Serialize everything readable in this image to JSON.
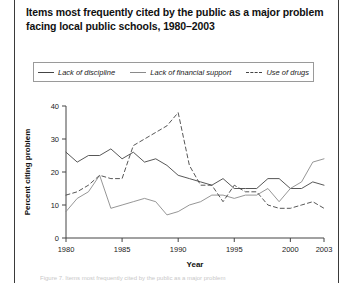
{
  "figure": {
    "title": "Items most frequently cited by the public as a major problem facing local public schools, 1980–2003",
    "footer_partial": "Figure 7. Items most frequently cited by the public as a major problem"
  },
  "legend": {
    "items": [
      {
        "label": "Lack of discipline",
        "style": "solid-dark",
        "color": "#444444"
      },
      {
        "label": "Lack of financial support",
        "style": "solid-mid",
        "color": "#8a8a8a"
      },
      {
        "label": "Use of drugs",
        "style": "dashed",
        "color": "#444444"
      }
    ]
  },
  "chart_data": {
    "type": "line",
    "title": "Items most frequently cited by the public as a major problem facing local public schools, 1980–2003",
    "xlabel": "Year",
    "ylabel": "Percent citing problem",
    "xlim": [
      1980,
      2003
    ],
    "ylim": [
      0,
      40
    ],
    "ytick_labels": [
      "0",
      "10",
      "20",
      "30",
      "40"
    ],
    "yticks": [
      0,
      10,
      20,
      30,
      40
    ],
    "xtick_labels": [
      "1980",
      "1985",
      "1990",
      "1995",
      "2000",
      "2003"
    ],
    "xticks": [
      1980,
      1985,
      1990,
      1995,
      2000,
      2003
    ],
    "grid": false,
    "legend_position": "top",
    "x": [
      1980,
      1981,
      1982,
      1983,
      1984,
      1985,
      1986,
      1987,
      1988,
      1989,
      1990,
      1991,
      1992,
      1993,
      1994,
      1995,
      1996,
      1997,
      1998,
      1999,
      2000,
      2001,
      2002,
      2003
    ],
    "series": [
      {
        "name": "Lack of discipline",
        "color": "#444444",
        "dash": "none",
        "values": [
          26,
          23,
          25,
          25,
          27,
          24,
          26,
          23,
          24,
          22,
          19,
          18,
          17,
          16,
          18,
          15,
          15,
          15,
          18,
          18,
          15,
          15,
          17,
          16
        ]
      },
      {
        "name": "Lack of financial support",
        "color": "#8a8a8a",
        "dash": "none",
        "values": [
          8,
          12,
          14,
          19,
          9,
          10,
          11,
          12,
          11,
          7,
          8,
          10,
          11,
          13,
          13,
          12,
          13,
          13,
          15,
          11,
          15,
          17,
          23,
          24
        ]
      },
      {
        "name": "Use of drugs",
        "color": "#444444",
        "dash": "dashed",
        "values": [
          13,
          14,
          16,
          19,
          18,
          18,
          28,
          30,
          32,
          34,
          38,
          22,
          16,
          16,
          11,
          16,
          14,
          14,
          10,
          9,
          9,
          10,
          11,
          9
        ]
      }
    ]
  }
}
